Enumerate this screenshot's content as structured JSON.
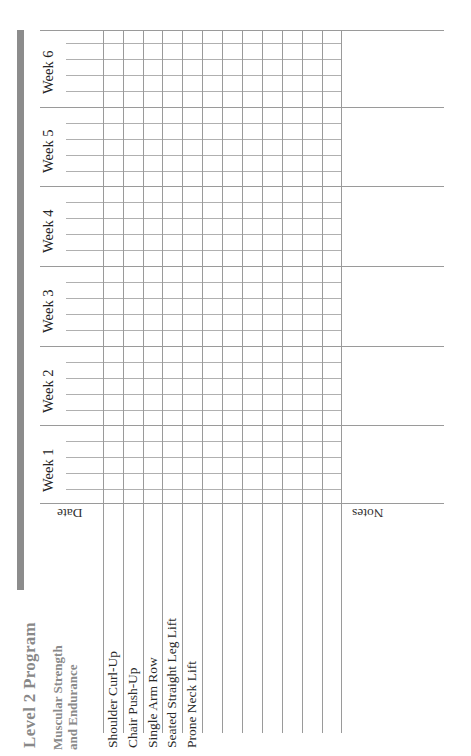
{
  "document": {
    "title": "Level 2 Program",
    "section_heading_line1": "Muscular Strength",
    "section_heading_line2": "and Endurance",
    "exercises": [
      "Shoulder Curl-Up",
      "Chair Push-Up",
      "Single Arm Row",
      "Seated Straight Leg Lift",
      "Prone Neck Lift"
    ],
    "weeks": [
      "Week 1",
      "Week 2",
      "Week 3",
      "Week 4",
      "Week 5",
      "Week 6"
    ],
    "date_label": "Date",
    "notes_label": "Notes",
    "accent_color": "#8c8c8c"
  }
}
